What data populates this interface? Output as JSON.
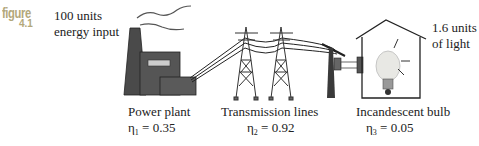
{
  "figure": {
    "word": "figure",
    "number": "4.1"
  },
  "input": {
    "line1": "100 units",
    "line2": "energy input"
  },
  "output": {
    "line1": "1.6 units",
    "line2": "of light"
  },
  "stages": [
    {
      "label": "Power plant",
      "eta_symbol": "η",
      "eta_sub": "1",
      "eta_value": "= 0.35"
    },
    {
      "label": "Transmission lines",
      "eta_symbol": "η",
      "eta_sub": "2",
      "eta_value": "= 0.92"
    },
    {
      "label": "Incandescent bulb",
      "eta_symbol": "η",
      "eta_sub": "3",
      "eta_value": "= 0.05"
    }
  ],
  "colors": {
    "figure_tag": "#b3a87a",
    "plant": "#4a4a4a",
    "lines": "#333333"
  }
}
